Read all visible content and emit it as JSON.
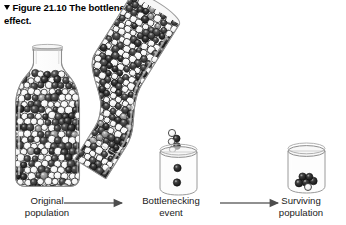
{
  "caption": {
    "marker_icon": "down-triangle-icon",
    "figure_label": "Figure 21.10",
    "text": "The bottleneck effect."
  },
  "stages": [
    {
      "id": "original",
      "line1": "Original",
      "line2": "population"
    },
    {
      "id": "event",
      "line1": "Bottlenecking",
      "line2": "event"
    },
    {
      "id": "surviving",
      "line1": "Surviving",
      "line2": "population"
    }
  ],
  "arrows": [
    {
      "id": "arrow-1",
      "icon": "right-arrow-icon"
    },
    {
      "id": "arrow-2",
      "icon": "right-arrow-icon"
    }
  ],
  "colors": {
    "background": "#ffffff",
    "text": "#000000",
    "glass_outline": "#8c8c8c",
    "glass_fill": "#fbfbfb",
    "marble_dark": "#3b3b3b",
    "marble_darker": "#262626",
    "marble_light": "#fdfdfd",
    "marble_mid": "#8f8f8f",
    "marble_outline": "#1f1f1f",
    "arrow": "#6b6b6b"
  },
  "artwork": {
    "upright_bottle": {
      "name": "original-population-bottle",
      "marble_counts": {
        "dark": 78,
        "light": 74,
        "mid": 7
      },
      "total_marbles": 159
    },
    "tilted_bottle": {
      "name": "bottlenecking-bottle",
      "rotation_degrees": 32,
      "marble_counts": {
        "dark": 72,
        "light": 66,
        "mid": 6
      },
      "total_marbles": 144
    },
    "pour_stream": {
      "name": "pour-stream",
      "marble_count": 5
    },
    "middle_beaker": {
      "name": "bottlenecking-beaker",
      "marbles": [
        {
          "shade": "dark"
        },
        {
          "shade": "dark"
        }
      ],
      "marble_count": 2
    },
    "right_beaker": {
      "name": "surviving-population-beaker",
      "marbles": [
        {
          "shade": "dark"
        },
        {
          "shade": "dark"
        },
        {
          "shade": "dark"
        },
        {
          "shade": "dark"
        },
        {
          "shade": "dark"
        },
        {
          "shade": "light"
        }
      ],
      "marble_count": 6
    }
  }
}
